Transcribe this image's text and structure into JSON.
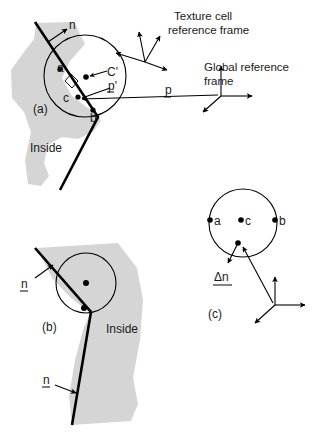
{
  "figure": {
    "background_color": "#ffffff",
    "solid_region_color": "#d5d5d5",
    "line_color": "#000000"
  },
  "panels": [
    {
      "id": "a",
      "label": "(a)",
      "region_label": "Inside",
      "point_labels": [
        "a",
        "b",
        "c"
      ],
      "normal_label": "n",
      "cell_center_label": "C'",
      "position_vector_label": "p'",
      "has_right_angle_marker": true
    },
    {
      "id": "b",
      "label": "(b)",
      "region_label": "Inside",
      "normal_labels": [
        "n",
        "n"
      ]
    },
    {
      "id": "c",
      "label": "(c)",
      "point_labels": [
        "a",
        "c",
        "b"
      ],
      "delta_label": "Δn"
    }
  ],
  "annotations": {
    "texture_frame": {
      "line1": "Texture cell",
      "line2": "reference frame"
    },
    "global_frame": {
      "line1": "Global reference",
      "line2": "frame"
    },
    "global_position_vector": "p"
  },
  "icon_names": [
    "arrow-head-icon",
    "axis-triad-icon",
    "right-angle-marker-icon",
    "circle-outline-icon",
    "point-dot-icon"
  ]
}
